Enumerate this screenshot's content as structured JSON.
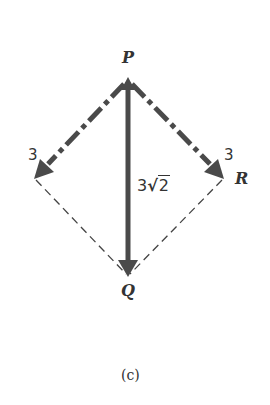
{
  "figure": {
    "caption": "(c)",
    "points": {
      "P": {
        "label": "P",
        "x": 128,
        "y": 80
      },
      "Q": {
        "label": "Q",
        "x": 128,
        "y": 276
      },
      "R": {
        "label": "R",
        "x": 224,
        "y": 178
      },
      "L": {
        "label": "",
        "x": 34,
        "y": 178
      }
    },
    "vectors": [
      {
        "from": "P",
        "to": "L",
        "style": "dash-dot",
        "magnitude_label": "3"
      },
      {
        "from": "P",
        "to": "R",
        "style": "dash-dot",
        "magnitude_label": "3"
      },
      {
        "from": "P",
        "to": "Q",
        "style": "solid",
        "magnitude_label": "3√2",
        "magnitude_coef": "3",
        "magnitude_radicand": "2"
      }
    ],
    "construction_lines": [
      {
        "from": "L",
        "to": "Q",
        "style": "dashed"
      },
      {
        "from": "R",
        "to": "Q",
        "style": "dashed"
      }
    ],
    "colors": {
      "vector": "#4a4a4a",
      "dashed": "#444444",
      "text": "#333333"
    }
  }
}
